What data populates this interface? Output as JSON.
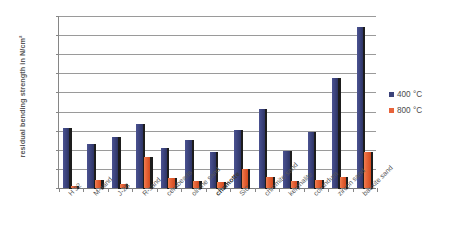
{
  "chart_data": {
    "type": "bar",
    "title": "",
    "xlabel": "",
    "ylabel": "residual bending strength in N/cm²",
    "ylim": [
      0,
      900
    ],
    "ytick_step": 100,
    "yticks": [
      "0",
      "100",
      "200",
      "300",
      "400",
      "500",
      "600",
      "700",
      "800",
      "900"
    ],
    "grid": true,
    "legend_position": "right",
    "categories": [
      "H 32",
      "M-sand",
      "J-2B",
      "R-sand",
      "cerabeads",
      "olivine sand",
      "chamotte",
      "SiC",
      "chromite sand",
      "kerphalite",
      "corundum",
      "zircon sand",
      "bauxite sand"
    ],
    "emphasized_categories": [
      "chamotte"
    ],
    "series": [
      {
        "name": "400 °C",
        "color": "#3b4279",
        "values": [
          312,
          232,
          268,
          337,
          212,
          250,
          187,
          305,
          415,
          196,
          295,
          575,
          845
        ]
      },
      {
        "name": "800 °C",
        "color": "#e8633a",
        "values": [
          12,
          40,
          20,
          163,
          52,
          37,
          30,
          101,
          60,
          35,
          40,
          60,
          190
        ]
      }
    ]
  },
  "legend": {
    "items": [
      {
        "label": "400 °C",
        "color": "#3b4279"
      },
      {
        "label": "800 °C",
        "color": "#e8633a"
      }
    ]
  },
  "axes": {
    "y_title": "residual bending strength in N/cm²"
  }
}
